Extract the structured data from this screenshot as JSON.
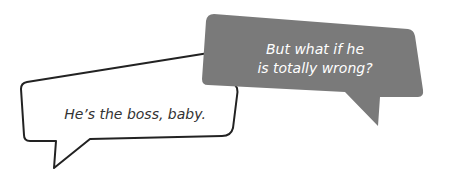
{
  "bubbles": [
    {
      "id": "white",
      "text": "He’s the boss, baby.",
      "fill": "#ffffff",
      "stroke": "#222222"
    },
    {
      "id": "gray",
      "line1": "But what if he",
      "line2": "is totally wrong?",
      "fill": "#7a7a7a",
      "text_color": "#ffffff"
    }
  ]
}
